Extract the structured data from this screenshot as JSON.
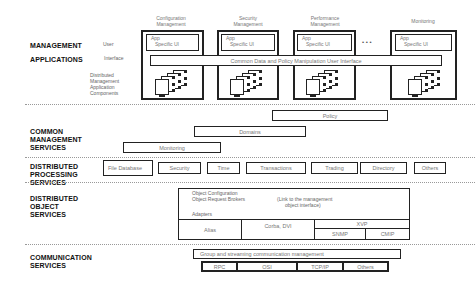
{
  "layers": {
    "management_applications": {
      "label_line1": "MANAGEMENT",
      "label_line2": "APPLICATIONS",
      "user_interface_label_1": "User",
      "user_interface_label_2": "Interface",
      "dist_apps_label": [
        "Distributed",
        "Management",
        "Application",
        "Components"
      ],
      "apps": [
        {
          "title_1": "Configuration",
          "title_2": "Management",
          "ui_1": "App",
          "ui_2": "Specific UI"
        },
        {
          "title_1": "Security",
          "title_2": "Management",
          "ui_1": "App",
          "ui_2": "Specific UI"
        },
        {
          "title_1": "Performance",
          "title_2": "Management",
          "ui_1": "App",
          "ui_2": "Specific UI"
        },
        {
          "title_1": "",
          "title_2": "Monitoring",
          "ui_1": "App",
          "ui_2": "Specific UI"
        }
      ],
      "ellipsis": "• • •",
      "common_ui_bar": "Common Data and Policy Manipulation User Interface"
    },
    "common_management": {
      "label_line1": "COMMON",
      "label_line2": "MANAGEMENT",
      "label_line3": "SERVICES",
      "policy": "Policy",
      "domains": "Domains",
      "monitoring": "Monitoring"
    },
    "distributed_processing": {
      "label_line1": "DISTRIBUTED",
      "label_line2": "PROCESSING",
      "label_line3": "SERVICES",
      "items": [
        "File Database",
        "Security",
        "Time",
        "Transactions",
        "Trading",
        "Directory",
        "Others"
      ]
    },
    "distributed_object": {
      "label_line1": "DISTRIBUTED",
      "label_line2": "OBJECT",
      "label_line3": "SERVICES",
      "top_line1": "Object Configuration",
      "top_line2": "Object Request Brokers",
      "top_note_1": "(Link to the management",
      "top_note_2": "object interface)",
      "adapters": "Adapters",
      "cells": [
        "Alias",
        "Corba, DVI"
      ],
      "xvp": "XVP",
      "xvp_sub": [
        "SNMP",
        "CMIP"
      ]
    },
    "communication": {
      "label_line1": "COMMUNICATION",
      "label_line2": "SERVICES",
      "bar": "Group and streaming communication management",
      "items": [
        "RPC",
        "OSI",
        "TCP/IP",
        "Others"
      ]
    }
  }
}
